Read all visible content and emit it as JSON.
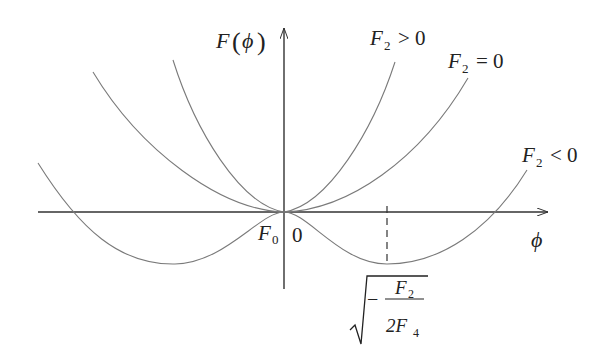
{
  "diagram": {
    "y_axis_label": "F",
    "y_axis_arg": "ϕ",
    "x_axis_label": "ϕ",
    "origin_labels": {
      "f0": "F",
      "f0_sub": "0",
      "zero": "0"
    },
    "curves": [
      {
        "name": "F2 > 0",
        "label_main": "F",
        "label_sub": "2",
        "label_rel": "> 0"
      },
      {
        "name": "F2 = 0",
        "label_main": "F",
        "label_sub": "2",
        "label_rel": "= 0"
      },
      {
        "name": "F2 < 0",
        "label_main": "F",
        "label_sub": "2",
        "label_rel": "< 0"
      }
    ],
    "minimum_label": {
      "minus": "−",
      "numerator": "F",
      "numerator_sub": "2",
      "denominator_coef": "2F",
      "denominator_sub": "4"
    },
    "colors": {
      "axis": "#333333",
      "curve": "#7a7a7a",
      "text": "#222222"
    }
  }
}
